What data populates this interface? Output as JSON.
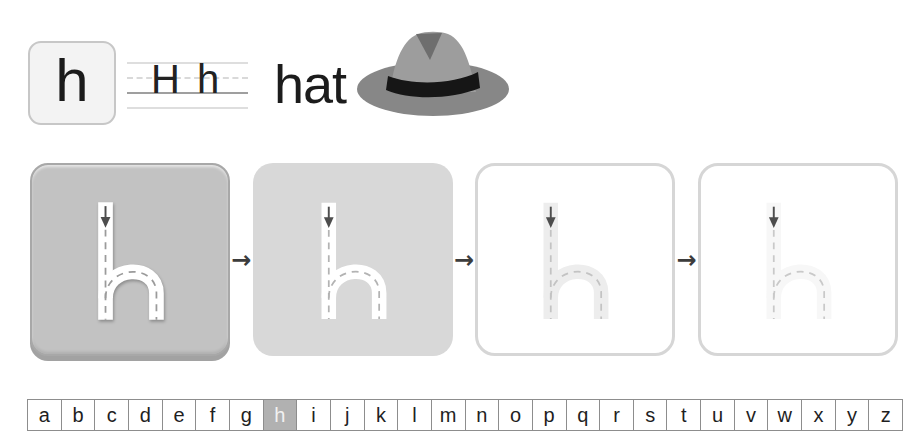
{
  "header": {
    "tile_letter": "h",
    "guide_text": "H h",
    "word": "hat",
    "illustration": "gray-fedora-hat",
    "hat_colors": {
      "brim": "#878787",
      "crown": "#9d9d9d",
      "dent": "#6e6e6e",
      "band": "#161616"
    }
  },
  "tracing": {
    "letter": "h",
    "separator_icon": "→",
    "stroke_arrow_color": "#4d4d4d",
    "stages": [
      {
        "id": "stage-1",
        "card_bg": "#c2c2c2",
        "card_border": "#a8a8a8",
        "letter_color": "#ffffff",
        "dash_color": "#9b9b9b",
        "raised": true
      },
      {
        "id": "stage-2",
        "card_bg": "#d8d8d8",
        "card_border": "transparent",
        "letter_color": "#ffffff",
        "dash_color": "#b3b3b3",
        "raised": false
      },
      {
        "id": "stage-3",
        "card_bg": "#ffffff",
        "card_border": "#d6d6d6",
        "letter_color": "#ededed",
        "dash_color": "#c3c3c3",
        "raised": false
      },
      {
        "id": "stage-4",
        "card_bg": "#ffffff",
        "card_border": "#d6d6d6",
        "letter_color": "#f7f7f7",
        "dash_color": "#c9c9c9",
        "raised": false
      }
    ]
  },
  "alphabet": {
    "letters": [
      "a",
      "b",
      "c",
      "d",
      "e",
      "f",
      "g",
      "h",
      "i",
      "j",
      "k",
      "l",
      "m",
      "n",
      "o",
      "p",
      "q",
      "r",
      "s",
      "t",
      "u",
      "v",
      "w",
      "x",
      "y",
      "z"
    ],
    "selected": "h",
    "selected_bg": "#b1b1b1",
    "selected_color": "#f2f2f2"
  }
}
